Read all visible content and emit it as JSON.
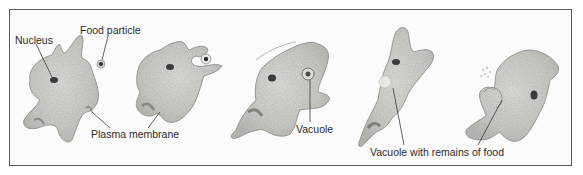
{
  "figure": {
    "stages": 5,
    "labels": {
      "nucleus": "Nucleus",
      "food_particle": "Food particle",
      "plasma_membrane": "Plasma membrane",
      "vacuole": "Vacuole",
      "vacuole_remains": "Vacuole with remains of food"
    },
    "colors": {
      "cell_fill": "#d9d9d4",
      "cell_outline": "#9a9a96",
      "nucleus": "#3a3a3a",
      "frame": "#5a5a5a",
      "text": "#2b2b2b"
    }
  }
}
